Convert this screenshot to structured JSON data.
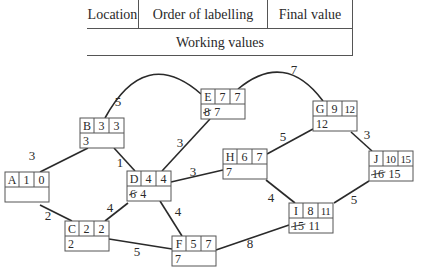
{
  "legend": {
    "location": "Location",
    "order_of_labelling": "Order of labelling",
    "final_value": "Final value",
    "working_values": "Working values"
  },
  "colors": {
    "line": "#2a2a2a",
    "box": "#555555",
    "text": "#2a2a2a"
  },
  "nodes": [
    {
      "id": "A",
      "x": 5,
      "y": 172,
      "order": "1",
      "final": "0",
      "working": []
    },
    {
      "id": "B",
      "x": 80,
      "y": 118,
      "order": "3",
      "final": "3",
      "working": [
        {
          "v": "3",
          "struck": false
        }
      ]
    },
    {
      "id": "C",
      "x": 65,
      "y": 221,
      "order": "2",
      "final": "2",
      "working": [
        {
          "v": "2",
          "struck": false
        }
      ]
    },
    {
      "id": "D",
      "x": 127,
      "y": 171,
      "order": "4",
      "final": "4",
      "working": [
        {
          "v": "6",
          "struck": true
        },
        {
          "v": "4",
          "struck": false
        }
      ]
    },
    {
      "id": "E",
      "x": 201,
      "y": 89,
      "order": "7",
      "final": "7",
      "working": [
        {
          "v": "8",
          "struck": true
        },
        {
          "v": "7",
          "struck": false
        }
      ]
    },
    {
      "id": "F",
      "x": 172,
      "y": 236,
      "order": "5",
      "final": "7",
      "working": [
        {
          "v": "7",
          "struck": false
        }
      ]
    },
    {
      "id": "G",
      "x": 313,
      "y": 101,
      "order": "9",
      "final": "12",
      "working": [
        {
          "v": "12",
          "struck": false
        }
      ]
    },
    {
      "id": "H",
      "x": 223,
      "y": 149,
      "order": "6",
      "final": "7",
      "working": [
        {
          "v": "7",
          "struck": false
        }
      ]
    },
    {
      "id": "I",
      "x": 289,
      "y": 203,
      "order": "8",
      "final": "11",
      "working": [
        {
          "v": "15",
          "struck": true
        },
        {
          "v": "11",
          "struck": false
        }
      ]
    },
    {
      "id": "J",
      "x": 369,
      "y": 151,
      "order": "10",
      "final": "15",
      "working": [
        {
          "v": "16",
          "struck": true
        },
        {
          "v": "15",
          "struck": false
        }
      ]
    }
  ],
  "edges": [
    {
      "from": "A",
      "to": "B",
      "weight": "3",
      "path": "M40,172 L88,148",
      "label": [
        32,
        160
      ]
    },
    {
      "from": "A",
      "to": "C",
      "weight": "2",
      "path": "M40,205 L72,221",
      "label": [
        48,
        220
      ]
    },
    {
      "from": "B",
      "to": "D",
      "weight": "1",
      "path": "M114,148 L135,171",
      "label": [
        120,
        167
      ]
    },
    {
      "from": "B",
      "to": "E",
      "weight": "5",
      "path": "M105,118 Q145,45 201,94",
      "label": [
        118,
        106
      ]
    },
    {
      "from": "C",
      "to": "D",
      "weight": "4",
      "path": "M105,221 L128,203",
      "label": [
        110,
        212
      ]
    },
    {
      "from": "C",
      "to": "F",
      "weight": "5",
      "path": "M109,239 L172,249",
      "label": [
        137,
        256
      ]
    },
    {
      "from": "D",
      "to": "E",
      "weight": "3",
      "path": "M162,171 L210,119",
      "label": [
        180,
        147
      ]
    },
    {
      "from": "D",
      "to": "H",
      "weight": "3",
      "path": "M171,182 L223,170",
      "label": [
        193,
        176
      ]
    },
    {
      "from": "D",
      "to": "F",
      "weight": "4",
      "path": "M160,201 L182,236",
      "label": [
        178,
        216
      ]
    },
    {
      "from": "E",
      "to": "G",
      "weight": "7",
      "path": "M238,89 Q285,50 323,101",
      "label": [
        294,
        74
      ]
    },
    {
      "from": "H",
      "to": "G",
      "weight": "5",
      "path": "M267,154 L313,129",
      "label": [
        283,
        141
      ]
    },
    {
      "from": "H",
      "to": "I",
      "weight": "4",
      "path": "M266,180 L295,203",
      "label": [
        271,
        202
      ]
    },
    {
      "from": "F",
      "to": "I",
      "weight": "8",
      "path": "M216,250 L289,225",
      "label": [
        250,
        248
      ]
    },
    {
      "from": "G",
      "to": "J",
      "weight": "3",
      "path": "M351,132 L372,151",
      "label": [
        367,
        139
      ]
    },
    {
      "from": "I",
      "to": "J",
      "weight": "5",
      "path": "M334,203 L369,181",
      "label": [
        354,
        204
      ]
    }
  ]
}
